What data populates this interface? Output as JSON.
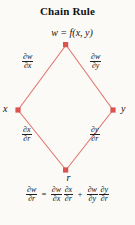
{
  "figure": {
    "title": "Chain Rule",
    "accent_color": "#e0766e",
    "node_marker_color": "#d9534f",
    "background_color": "#fbfaf7",
    "text_color": "#111111"
  },
  "nodes": {
    "top": {
      "label": "w = f(x, y)",
      "name": "w"
    },
    "left": {
      "label": "x",
      "name": "x"
    },
    "right": {
      "label": "y",
      "name": "y"
    },
    "bottom": {
      "label": "r",
      "name": "r"
    }
  },
  "edges": {
    "upper_left": {
      "numerator": "∂w",
      "denominator": "∂x",
      "from": "w",
      "to": "x"
    },
    "upper_right": {
      "numerator": "∂w",
      "denominator": "∂y",
      "from": "w",
      "to": "y"
    },
    "lower_left": {
      "numerator": "∂x",
      "denominator": "∂r",
      "from": "x",
      "to": "r"
    },
    "lower_right": {
      "numerator": "∂y",
      "denominator": "∂r",
      "from": "y",
      "to": "r"
    }
  },
  "equation": {
    "lhs": {
      "numerator": "∂w",
      "denominator": "∂r"
    },
    "equals": "=",
    "term1": [
      {
        "numerator": "∂w",
        "denominator": "∂x"
      },
      {
        "numerator": "∂x",
        "denominator": "∂r"
      }
    ],
    "plus": "+",
    "term2": [
      {
        "numerator": "∂w",
        "denominator": "∂y"
      },
      {
        "numerator": "∂y",
        "denominator": "∂r"
      }
    ],
    "full_text": "∂w/∂r = ∂w/∂x ∂x/∂r + ∂w/∂y ∂y/∂r"
  }
}
